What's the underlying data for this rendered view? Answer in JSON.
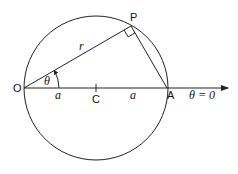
{
  "diagram": {
    "type": "geometry",
    "labels": {
      "O": "O",
      "P": "P",
      "C": "C",
      "A": "A",
      "r": "r",
      "theta": "θ",
      "a_left": "a",
      "a_right": "a",
      "axis": "θ = 0"
    },
    "colors": {
      "stroke": "#222222",
      "background": "#ffffff"
    }
  }
}
